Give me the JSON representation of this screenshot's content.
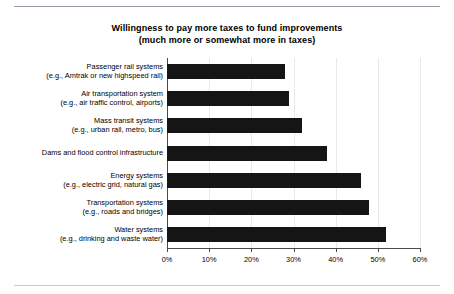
{
  "chart_data": {
    "type": "bar",
    "orientation": "horizontal",
    "title": "Willingness to pay more taxes to fund improvements",
    "subtitle": "(much more or somewhat more in taxes)",
    "xlabel": "",
    "ylabel": "",
    "xlim": [
      0,
      60
    ],
    "xticks": [
      "0%",
      "10%",
      "20%",
      "30%",
      "40%",
      "50%",
      "60%"
    ],
    "xtick_values": [
      0,
      10,
      20,
      30,
      40,
      50,
      60
    ],
    "grid": true,
    "legend": false,
    "bar_color": "#151515",
    "categories": [
      "Passenger rail systems (e.g., Amtrak or new highspeed rail)",
      "Air transportation system (e.g., air traffic control, airports)",
      "Mass transit systems (e.g., urban rail, metro, bus)",
      "Dams and flood control infrastructure",
      "Energy systems (e.g., electric grid, natural gas)",
      "Transportation systems (e.g., roads and bridges)",
      "Water systems (e.g., drinking and waste water)"
    ],
    "values": [
      28,
      29,
      32,
      38,
      46,
      48,
      52
    ],
    "bars": [
      {
        "label_main": "Passenger rail systems",
        "label_sub": "(e.g., Amtrak or new highspeed rail)",
        "value": 28
      },
      {
        "label_main": "Air transportation system",
        "label_sub": "(e.g., air traffic control, airports)",
        "value": 29
      },
      {
        "label_main": "Mass transit systems",
        "label_sub": "(e.g., urban rail, metro, bus)",
        "value": 32
      },
      {
        "label_main": "Dams and flood control infrastructure",
        "label_sub": "",
        "value": 38
      },
      {
        "label_main": "Energy systems",
        "label_sub": "(e.g., electric grid, natural gas)",
        "value": 46
      },
      {
        "label_main": "Transportation systems",
        "label_sub": "(e.g., roads and bridges)",
        "value": 48
      },
      {
        "label_main": "Water systems",
        "label_sub": "(e.g., drinking and waste water)",
        "value": 52
      }
    ]
  }
}
